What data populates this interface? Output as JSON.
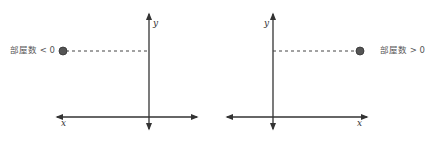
{
  "diagrams": [
    {
      "id": "negative",
      "point_label": "部屋数 < 0",
      "x_axis_label": "x",
      "y_axis_label": "y",
      "point_position": "left of y-axis, above x-axis"
    },
    {
      "id": "positive",
      "point_label": "部屋数 > 0",
      "x_axis_label": "x",
      "y_axis_label": "y",
      "point_position": "right of y-axis, above x-axis"
    }
  ],
  "colors": {
    "axis": "#333333",
    "point": "#555555",
    "dashed_line": "#444444",
    "label": "#555555"
  }
}
